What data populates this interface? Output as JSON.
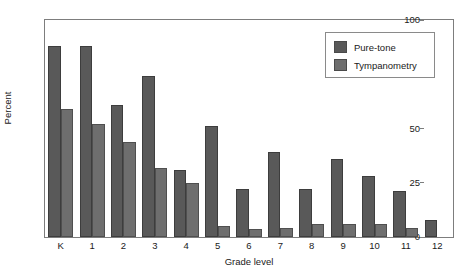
{
  "chart_data": {
    "type": "bar",
    "title": "",
    "xlabel": "Grade level",
    "ylabel": "Percent",
    "ylim": [
      0,
      100
    ],
    "yticks": [
      0,
      25,
      50,
      75,
      100
    ],
    "ytick_labels": [
      "0",
      "25",
      "50",
      "75",
      "100"
    ],
    "grid": false,
    "legend_position": "top-right",
    "categories": [
      "K",
      "1",
      "2",
      "3",
      "4",
      "5",
      "6",
      "7",
      "8",
      "9",
      "10",
      "11",
      "12"
    ],
    "series": [
      {
        "name": "Pure-tone",
        "color": "#595959",
        "values": [
          88,
          88,
          61,
          74,
          31,
          51,
          22,
          39,
          22,
          36,
          28,
          21,
          8
        ]
      },
      {
        "name": "Tympanometry",
        "color": "#6e6e6e",
        "values": [
          59,
          52,
          44,
          32,
          25,
          5,
          3.5,
          4,
          6,
          6,
          6,
          4,
          0
        ]
      }
    ]
  },
  "legend": {
    "entries": [
      {
        "label": "Pure-tone",
        "swatch": "pure"
      },
      {
        "label": "Tympanometry",
        "swatch": "tymp"
      }
    ]
  },
  "colors": {
    "pure_tone": "#595959",
    "tympanometry": "#6e6e6e",
    "axis": "#7d7d7d",
    "background": "#ffffff"
  }
}
